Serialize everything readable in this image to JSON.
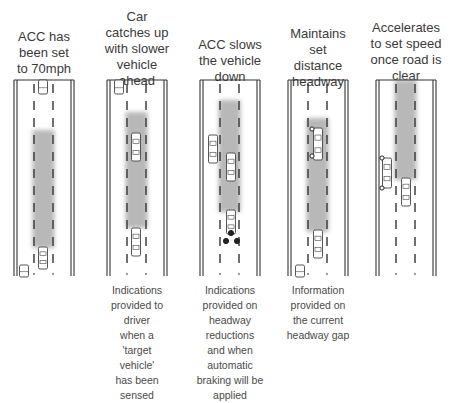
{
  "diagram": {
    "colors": {
      "road_line": "#333333",
      "radar_beam": "#b8b8b8",
      "car_outline": "#444444",
      "indicator": "#222222",
      "text": "#3a3a3a"
    },
    "panels": [
      {
        "id": "set-speed",
        "title": "ACC has\nbeen set\nto 70mph",
        "title_top": 29,
        "caption": "",
        "road_x": 14,
        "beam": {
          "y1": 130,
          "y2": 248,
          "width": 22
        },
        "cars": [
          {
            "role": "ego",
            "x": 43,
            "y": 247,
            "h": 22
          },
          {
            "role": "ahead-far",
            "x": 43,
            "y": 80,
            "h": 14
          },
          {
            "role": "other-lane",
            "x": 24,
            "y": 265,
            "h": 12
          }
        ],
        "indicators": []
      },
      {
        "id": "catches-up",
        "title": "Car\ncatches up\nwith slower\nvehicle\nahead",
        "title_top": 9,
        "caption": "Indications\nprovided to\ndriver\nwhen a\n'target\nvehicle'\nhas been\nsensed",
        "road_x": 107,
        "beam": {
          "y1": 112,
          "y2": 228,
          "width": 22
        },
        "cars": [
          {
            "role": "target-vehicle",
            "x": 136,
            "y": 133,
            "h": 28
          },
          {
            "role": "ego",
            "x": 136,
            "y": 228,
            "h": 28
          },
          {
            "role": "other-lane",
            "x": 119,
            "y": 80,
            "h": 14
          }
        ],
        "indicators": []
      },
      {
        "id": "slows-down",
        "title": "ACC slows\nthe vehicle\ndown",
        "title_top": 37,
        "caption": "Indications\nprovided on\nheadway\nreductions\nand when\nautomatic\nbraking will be\napplied",
        "road_x": 200,
        "beam": {
          "y1": 100,
          "y2": 212,
          "width": 22
        },
        "cars": [
          {
            "role": "target-vehicle",
            "x": 231,
            "y": 153,
            "h": 28
          },
          {
            "role": "ego",
            "x": 231,
            "y": 210,
            "h": 24
          },
          {
            "role": "other-lane",
            "x": 213,
            "y": 135,
            "h": 28
          }
        ],
        "indicators": [
          {
            "type": "brake-light",
            "x": 231,
            "y": 233
          },
          {
            "type": "brake-light",
            "x": 226,
            "y": 241
          },
          {
            "type": "brake-light",
            "x": 237,
            "y": 241
          }
        ]
      },
      {
        "id": "maintains-headway",
        "title": "Maintains\nset\ndistance\nheadway",
        "title_top": 26,
        "caption": "Information\nprovided on\nthe current\nheadway gap",
        "road_x": 288,
        "beam": {
          "y1": 118,
          "y2": 232,
          "width": 22
        },
        "cars": [
          {
            "role": "target-vehicle",
            "x": 318,
            "y": 128,
            "h": 32
          },
          {
            "role": "ego",
            "x": 318,
            "y": 230,
            "h": 28
          },
          {
            "role": "other-lane",
            "x": 300,
            "y": 265,
            "h": 12
          }
        ],
        "indicators": [
          {
            "type": "indicator-light",
            "x": 312,
            "y": 129
          },
          {
            "type": "indicator-light",
            "x": 312,
            "y": 156
          }
        ]
      },
      {
        "id": "accelerates",
        "title": "Accelerates\nto set speed\nonce road is\nclear",
        "title_top": 20,
        "caption": "",
        "road_x": 376,
        "beam": {
          "y1": 80,
          "y2": 180,
          "width": 22
        },
        "cars": [
          {
            "role": "ego",
            "x": 406,
            "y": 178,
            "h": 28
          },
          {
            "role": "merging-vehicle",
            "x": 387,
            "y": 158,
            "h": 30
          }
        ],
        "indicators": [
          {
            "type": "indicator-light",
            "x": 382,
            "y": 158
          },
          {
            "type": "indicator-light",
            "x": 382,
            "y": 188
          }
        ]
      }
    ]
  }
}
